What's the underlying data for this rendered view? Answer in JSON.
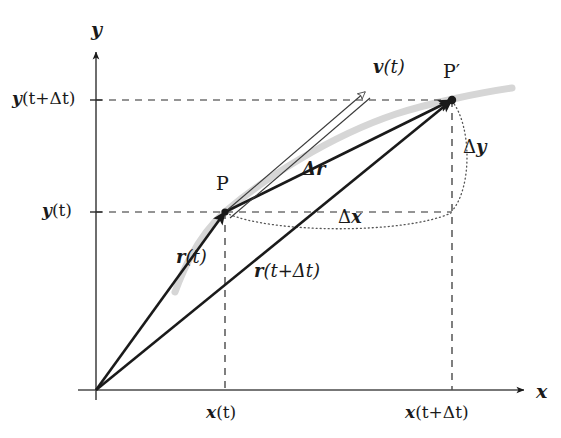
{
  "figure": {
    "type": "physics-vector-diagram",
    "width": 561,
    "height": 438,
    "background_color": "#ffffff",
    "ink_color": "#1a1a1a",
    "trajectory_color": "#d4d4d4"
  },
  "axes": {
    "origin": {
      "x": 96,
      "y": 390
    },
    "x_axis": {
      "label": "x",
      "tip": {
        "x": 528,
        "y": 390
      },
      "ticks": [
        {
          "label_plain": "x(t)",
          "label_main": "x",
          "label_arg": "(t)",
          "x": 225
        },
        {
          "label_plain": "x(t+Δt)",
          "label_main": "x",
          "label_arg": "(t+Δt)",
          "x": 452
        }
      ]
    },
    "y_axis": {
      "label": "y",
      "tip": {
        "x": 96,
        "y": 48
      },
      "ticks": [
        {
          "label_plain": "y(t+Δt)",
          "label_main": "y",
          "label_arg": "(t+Δt)",
          "y": 100
        },
        {
          "label_plain": "y(t)",
          "label_main": "y",
          "label_arg": "(t)",
          "y": 212
        }
      ]
    }
  },
  "points": [
    {
      "id": "P",
      "label": "P",
      "x": 225,
      "y": 212,
      "label_x": 216,
      "label_y": 182
    },
    {
      "id": "Pprime",
      "label": "P′",
      "x": 452,
      "y": 100,
      "label_x": 446,
      "label_y": 70
    }
  ],
  "vectors": [
    {
      "id": "r_t",
      "label_plain": "r(t)",
      "label_main": "r",
      "label_arg": "(t)",
      "from": {
        "x": 96,
        "y": 390
      },
      "to": {
        "x": 225,
        "y": 212
      },
      "style": "solid-filled-arrow",
      "label_x": 185,
      "label_y": 256
    },
    {
      "id": "r_t_dt",
      "label_plain": "r(t+Δt)",
      "label_main": "r",
      "label_arg": "(t+Δt)",
      "from": {
        "x": 96,
        "y": 390
      },
      "to": {
        "x": 452,
        "y": 100
      },
      "style": "solid-filled-arrow",
      "label_x": 264,
      "label_y": 268
    },
    {
      "id": "delta_r",
      "label_plain": "Δr",
      "label_main": "Δr",
      "label_arg": "",
      "from": {
        "x": 225,
        "y": 212
      },
      "to": {
        "x": 452,
        "y": 100
      },
      "style": "solid-filled-arrow",
      "label_x": 311,
      "label_y": 168
    },
    {
      "id": "v_t",
      "label_plain": "v(t)",
      "label_main": "v",
      "label_arg": "(t)",
      "from": {
        "x": 225,
        "y": 212
      },
      "to": {
        "x": 372,
        "y": 86
      },
      "style": "hollow-outline-arrow",
      "label_x": 380,
      "label_y": 68
    }
  ],
  "braces": [
    {
      "id": "delta-y",
      "label_plain": "Δy",
      "label_main": "Δ",
      "label_arg": "y",
      "orientation": "vertical",
      "from": {
        "x": 452,
        "y": 100
      },
      "to": {
        "x": 452,
        "y": 212
      },
      "label_x": 466,
      "label_y": 146
    },
    {
      "id": "delta-x",
      "label_plain": "Δx",
      "label_main": "Δ",
      "label_arg": "x",
      "orientation": "horizontal",
      "from": {
        "x": 225,
        "y": 212
      },
      "to": {
        "x": 452,
        "y": 212
      },
      "label_x": 340,
      "label_y": 214
    }
  ],
  "guides": {
    "dashed_horizontal": [
      {
        "id": "y-upper-guide",
        "y": 100,
        "from_x": 96,
        "to_x": 452
      },
      {
        "id": "y-lower-guide",
        "y": 212,
        "from_x": 96,
        "to_x": 452
      }
    ],
    "dashed_vertical": [
      {
        "id": "x-left-guide",
        "x": 225,
        "from_y": 212,
        "to_y": 390
      },
      {
        "id": "x-right-guide",
        "x": 452,
        "from_y": 100,
        "to_y": 390
      }
    ]
  },
  "trajectory": {
    "id": "particle-path",
    "description": "smooth grey curve through P and P'",
    "color": "#d6d6d6"
  }
}
